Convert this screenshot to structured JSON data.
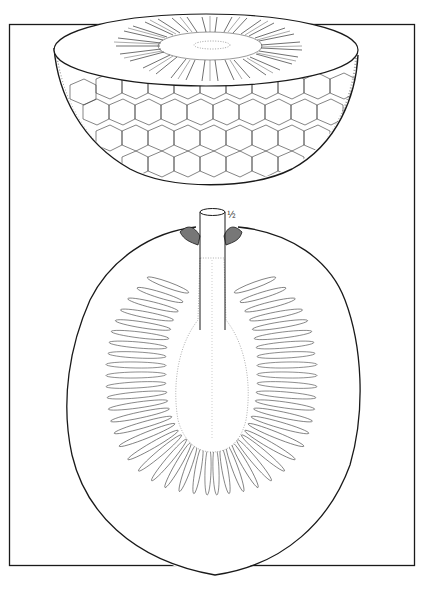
{
  "illustration": {
    "subject": "breadfruit",
    "views": [
      {
        "name": "half-fruit-cross-section",
        "description": "hemispherical half fruit showing polygonal skin and radial seed pattern on the cut face"
      },
      {
        "name": "longitudinal-section",
        "description": "oval longitudinal section showing central core/stalk and radiating seed cavities"
      }
    ],
    "scale_mark": "½",
    "colors": {
      "ink": "#1a1a1a",
      "paper": "#ffffff"
    }
  }
}
